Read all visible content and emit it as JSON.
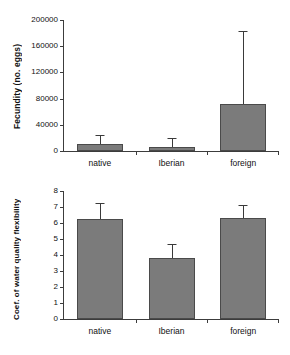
{
  "chart_data": [
    {
      "id": "fecundity",
      "type": "bar",
      "title": "",
      "xlabel": "",
      "ylabel": "Fecundity (no. eggs)",
      "categories": [
        "native",
        "Iberian",
        "foreign"
      ],
      "values": [
        10000,
        6000,
        72000
      ],
      "errors_upper": [
        25000,
        20000,
        183000
      ],
      "ylim": [
        0,
        200000
      ],
      "yticks": [
        0,
        40000,
        80000,
        120000,
        160000,
        200000
      ],
      "ytick_labels": [
        "0",
        "40000",
        "80000",
        "120000",
        "160000",
        "200000"
      ],
      "grid": false,
      "legend": "none",
      "bar_color": "#7b7b7b",
      "bar_edge_color": "#4a4a4a",
      "axis_color": "#3c3c3c"
    },
    {
      "id": "water-quality-flexibility",
      "type": "bar",
      "title": "",
      "xlabel": "",
      "ylabel": "Coef. of water quality flexibility",
      "categories": [
        "native",
        "Iberian",
        "foreign"
      ],
      "values": [
        6.25,
        3.8,
        6.3
      ],
      "errors_upper": [
        7.25,
        4.7,
        7.15
      ],
      "ylim": [
        0,
        8
      ],
      "yticks": [
        0,
        1,
        2,
        3,
        4,
        5,
        6,
        7,
        8
      ],
      "ytick_labels": [
        "0",
        "1",
        "2",
        "3",
        "4",
        "5",
        "6",
        "7",
        "8"
      ],
      "grid": false,
      "legend": "none",
      "bar_color": "#7b7b7b",
      "bar_edge_color": "#4a4a4a",
      "axis_color": "#3c3c3c"
    }
  ]
}
